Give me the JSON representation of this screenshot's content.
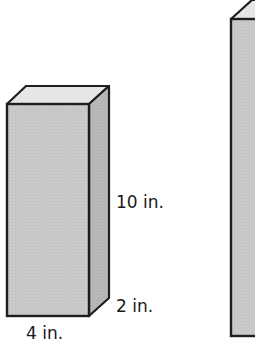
{
  "figure": {
    "prism_a": {
      "labels": {
        "height": "10 in.",
        "depth": "2 in.",
        "width": "4 in."
      }
    },
    "prism_b": {
      "labels": {}
    }
  },
  "colors": {
    "front_face": "#c9c9c9",
    "side_face": "#b5b5b5",
    "top_face": "#e6e6e6",
    "edge": "#1e1e1e"
  }
}
